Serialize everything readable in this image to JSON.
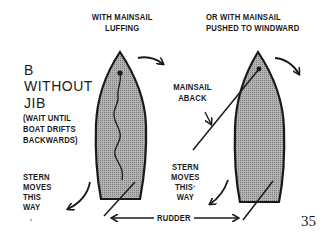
{
  "diagram": {
    "section_letter": "B",
    "section_title_lines": [
      "WITHOUT",
      "JIB"
    ],
    "section_note_lines": [
      "(WAIT UNTIL",
      "BOAT DRIFTS",
      "BACKWARDS)"
    ],
    "left_boat": {
      "caption_lines": [
        "WITH MAINSAIL",
        "LUFFING"
      ],
      "stern_label_lines": [
        "STERN",
        "MOVES",
        "THIS",
        "WAY"
      ]
    },
    "right_boat": {
      "caption_lines": [
        "OR WITH MAINSAIL",
        "PUSHED TO WINDWARD"
      ],
      "sail_label_lines": [
        "MAINSAIL",
        "ABACK"
      ],
      "stern_label_lines": [
        "STERN",
        "MOVES",
        "THIS·",
        "WAY"
      ]
    },
    "rudder_label": "RUDDER",
    "page_number": "35",
    "colors": {
      "hull_fill": "#a8a8a8",
      "outline": "#1a1a1a",
      "background": "#ffffff"
    }
  }
}
